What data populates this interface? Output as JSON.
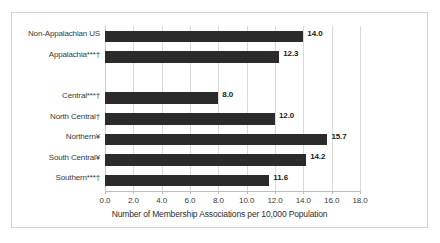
{
  "chart_data": {
    "type": "bar",
    "orientation": "horizontal",
    "title": "",
    "xlabel": "Number of Membership Associations per 10,000 Population",
    "ylabel": "",
    "xlim": [
      0.0,
      18.0
    ],
    "xticks": [
      "0.0",
      "2.0",
      "4.0",
      "6.0",
      "8.0",
      "10.0",
      "12.0",
      "14.0",
      "16.0",
      "18.0"
    ],
    "xtick_values": [
      0,
      2,
      4,
      6,
      8,
      10,
      12,
      14,
      16,
      18
    ],
    "grid": "vertical",
    "legend": "none",
    "bar_color": "#2b2b2b",
    "categories": [
      "Non-Appalachian US",
      "Appalachia***†",
      "",
      "Central***†",
      "North Central†",
      "Northern¥",
      "South Central¥",
      "Southern***†"
    ],
    "values": [
      14.0,
      12.3,
      null,
      8.0,
      12.0,
      15.7,
      14.2,
      11.6
    ],
    "value_labels": [
      "14.0",
      "12.3",
      "",
      "8.0",
      "12.0",
      "15.7",
      "14.2",
      "11.6"
    ],
    "bars": [
      {
        "label": "Non-Appalachian US",
        "value": 14.0,
        "value_label": "14.0"
      },
      {
        "label": "Appalachia***†",
        "value": 12.3,
        "value_label": "12.3"
      },
      {
        "label": "",
        "value": null,
        "value_label": ""
      },
      {
        "label": "Central***†",
        "value": 8.0,
        "value_label": "8.0"
      },
      {
        "label": "North Central†",
        "value": 12.0,
        "value_label": "12.0"
      },
      {
        "label": "Northern¥",
        "value": 15.7,
        "value_label": "15.7"
      },
      {
        "label": "South Central¥",
        "value": 14.2,
        "value_label": "14.2"
      },
      {
        "label": "Southern***†",
        "value": 11.6,
        "value_label": "11.6"
      }
    ]
  }
}
